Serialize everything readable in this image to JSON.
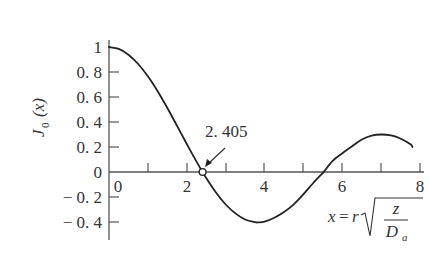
{
  "chart_data": {
    "type": "line",
    "title": "",
    "xlabel": "x = r√(z/D_a)",
    "ylabel": "J0(x)",
    "xlim": [
      0,
      8
    ],
    "ylim": [
      -0.45,
      1.0
    ],
    "grid": false,
    "legend": null,
    "x_ticks": [
      0,
      1,
      2,
      3,
      4,
      5,
      6,
      7,
      8
    ],
    "x_tick_labels": [
      "0",
      "2",
      "4",
      "6",
      "8"
    ],
    "x_tick_label_values": [
      0,
      2,
      4,
      6,
      8
    ],
    "y_ticks": [
      1,
      0.8,
      0.6,
      0.4,
      0.2,
      0,
      -0.2,
      -0.4
    ],
    "y_tick_labels": [
      "1",
      "0.8",
      "0.6",
      "0.4",
      "0.2",
      "0",
      "−0.2",
      "−0.4"
    ],
    "series": [
      {
        "name": "J0(x)",
        "color": "#222222",
        "x": [
          0,
          0.25,
          0.5,
          0.75,
          1,
          1.25,
          1.5,
          1.75,
          2,
          2.25,
          2.405,
          2.5,
          2.75,
          3,
          3.25,
          3.5,
          3.75,
          3.83,
          4,
          4.25,
          4.5,
          4.75,
          5,
          5.25,
          5.5,
          5.52,
          5.75,
          6,
          6.25,
          6.5,
          6.75,
          7,
          7.25,
          7.5,
          7.75,
          7.8
        ],
        "values": [
          1,
          0.9844,
          0.9385,
          0.8642,
          0.7652,
          0.6459,
          0.5118,
          0.369,
          0.2239,
          0.0827,
          0,
          -0.0484,
          -0.1641,
          -0.2601,
          -0.331,
          -0.3801,
          -0.4018,
          -0.4028,
          -0.3971,
          -0.3656,
          -0.3205,
          -0.2591,
          -0.1776,
          -0.088,
          -0.0068,
          0,
          0.0891,
          0.1506,
          0.2058,
          0.2601,
          0.2914,
          0.3001,
          0.2921,
          0.2663,
          0.2214,
          0.2
        ]
      }
    ],
    "annotations": [
      {
        "text": "2.405",
        "x": 2.405,
        "y": 0,
        "marker": "open-circle",
        "arrow": true
      }
    ]
  },
  "labels": {
    "y_axis_main": "J",
    "y_axis_sub": "0",
    "y_axis_arg": "(x)",
    "x_axis_lhs": "x",
    "x_axis_eq": "=",
    "x_axis_r": "r",
    "x_axis_num": "z",
    "x_axis_den": "D",
    "x_axis_den_sub": "a",
    "annotation": "2. 405",
    "x_ticks": [
      "0",
      "2",
      "4",
      "6",
      "8"
    ],
    "y_ticks": [
      "1",
      "0. 8",
      "0. 6",
      "0. 4",
      "0. 2",
      "0",
      "− 0. 2",
      "− 0. 4"
    ]
  }
}
